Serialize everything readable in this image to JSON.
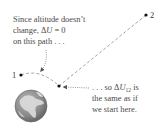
{
  "diagram": {
    "points": [
      {
        "id": "1",
        "label": "1",
        "x": 21,
        "y": 75
      },
      {
        "id": "mid",
        "label": "",
        "x": 59,
        "y": 86
      },
      {
        "id": "2",
        "label": "2",
        "x": 146,
        "y": 15
      }
    ],
    "paths": [
      {
        "from": "1",
        "to": "mid",
        "style": "dashed",
        "note": "constant altitude arc"
      },
      {
        "from": "mid",
        "to": "2",
        "style": "dashed",
        "note": "straight path"
      }
    ],
    "annotations": {
      "top": {
        "line1": "Since altitude doesn’t",
        "line2_prefix": "change, Δ",
        "line2_var": "U",
        "line2_suffix": " = 0",
        "line3": "on this path . . ."
      },
      "bottom": {
        "line1_prefix": ". . . so Δ",
        "line1_var": "U",
        "line1_sub": "12",
        "line1_suffix": " is",
        "line2": "the same as if",
        "line3": "we start here."
      }
    },
    "earth": {
      "cx": 31,
      "cy": 106,
      "r": 16,
      "name": "earth-icon"
    },
    "colors": {
      "text": "#4a4a4a",
      "dashes": "#9a9a9a",
      "dots": "#111111",
      "arrow": "#7a7a7a",
      "earth_land": "#d8d8d8",
      "earth_ocean": "#8a8a8a"
    }
  }
}
